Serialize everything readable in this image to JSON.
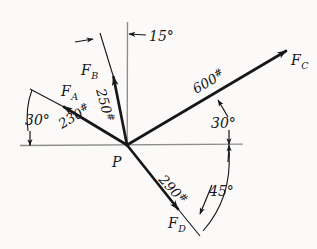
{
  "figure": {
    "type": "free-body-force-diagram",
    "origin_label": "P",
    "background_color": "#fbfaf8",
    "ink_color": "#17161a",
    "reference_line_color": "#8d8d8d"
  },
  "vectors": [
    {
      "id": "FA",
      "name": "F",
      "subscript": "A",
      "magnitude": "230",
      "unit": "#",
      "magnitude_label": "230#",
      "angle_deg": 30,
      "angle_label": "30°",
      "angle_reference": "horizontal-left",
      "direction": "up-left"
    },
    {
      "id": "FB",
      "name": "F",
      "subscript": "B",
      "magnitude": "250",
      "unit": "#",
      "magnitude_label": "250#",
      "angle_deg": 15,
      "angle_label": "15°",
      "angle_reference": "vertical",
      "direction": "up-left-steep"
    },
    {
      "id": "FC",
      "name": "F",
      "subscript": "C",
      "magnitude": "600",
      "unit": "#",
      "magnitude_label": "600#",
      "angle_deg": 30,
      "angle_label": "30°",
      "angle_reference": "horizontal-right",
      "direction": "up-right"
    },
    {
      "id": "FD",
      "name": "F",
      "subscript": "D",
      "magnitude": "290",
      "unit": "#",
      "magnitude_label": "290#",
      "angle_deg": 45,
      "angle_label": "45°",
      "angle_reference": "horizontal-right",
      "direction": "down-right"
    }
  ],
  "labels": {
    "origin": "P",
    "fa_name": "F",
    "fa_sub": "A",
    "fa_mag": "230",
    "fa_unit": "#",
    "fb_name": "F",
    "fb_sub": "B",
    "fb_mag": "250",
    "fb_unit": "#",
    "fc_name": "F",
    "fc_sub": "C",
    "fc_mag": "600",
    "fc_unit": "#",
    "fd_name": "F",
    "fd_sub": "D",
    "fd_mag": "290",
    "fd_unit": "#",
    "angle_15": "15°",
    "angle_30_left": "30°",
    "angle_30_right": "30°",
    "angle_45": "45°"
  }
}
